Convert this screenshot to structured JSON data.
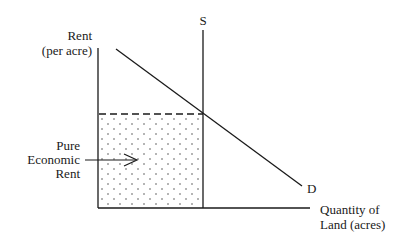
{
  "diagram": {
    "title": "Pure Economic Rent",
    "y_axis_label": [
      "Rent",
      "(per acre)"
    ],
    "x_axis_label": [
      "Quantity of",
      "Land (acres)"
    ],
    "supply_label": "S",
    "demand_label": "D",
    "shaded_region_label": [
      "Pure",
      "Economic",
      "Rent"
    ],
    "colors": {
      "line": "#1a1a1a",
      "background": "#ffffff",
      "dots": "#555555"
    }
  }
}
